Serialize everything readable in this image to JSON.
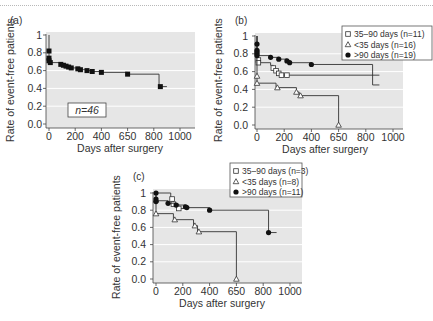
{
  "figure": {
    "background": "#ffffff",
    "plot_background": "#e6e6e6",
    "gridline_color": "#ffffff",
    "line_color": "#333333"
  },
  "chart_data": [
    {
      "panel_label": "(a)",
      "type": "line",
      "subtype": "kaplan-meier step",
      "title": "",
      "xlabel": "Days after surgery",
      "ylabel": "Rate of event-free patients",
      "xlim": [
        0,
        1000
      ],
      "ylim": [
        0,
        1
      ],
      "x_ticks": [
        0,
        200,
        400,
        600,
        800,
        1000
      ],
      "x_tick_labels": [
        "0",
        "200",
        "400",
        "650",
        "800",
        "1000"
      ],
      "y_ticks": [
        0,
        0.2,
        0.4,
        0.6,
        0.8,
        1
      ],
      "y_tick_labels": [
        "0.0",
        "0.2",
        "0.4",
        "0.6",
        "0.8",
        "1"
      ],
      "grid": true,
      "annotation": "n=46",
      "layout": {
        "x0": 49,
        "x1000": 180,
        "y0": 124,
        "y1": 35,
        "bg": [
          46,
          32,
          195,
          128
        ],
        "ytick_x": 44,
        "xtick_y": 140,
        "xlabel_pos": [
          120,
          152
        ],
        "ylabel_pos": [
          14,
          80
        ],
        "panel_label_pos": [
          10,
          24
        ],
        "annot_box": [
          68,
          103,
          38,
          14
        ]
      },
      "series": [
        {
          "name": "All patients (n=46)",
          "marker": "filled-square",
          "steps": [
            [
              0,
              1.0
            ],
            [
              0,
              0.74
            ],
            [
              0,
              0.71
            ],
            [
              10,
              0.69
            ],
            [
              90,
              0.67
            ],
            [
              110,
              0.66
            ],
            [
              130,
              0.65
            ],
            [
              150,
              0.64
            ],
            [
              170,
              0.63
            ],
            [
              220,
              0.62
            ],
            [
              240,
              0.61
            ],
            [
              290,
              0.6
            ],
            [
              330,
              0.59
            ],
            [
              400,
              0.58
            ],
            [
              600,
              0.56
            ],
            [
              840,
              0.42
            ]
          ],
          "end_x": 900,
          "censored": [
            [
              0,
              0.82
            ],
            [
              0,
              0.74
            ],
            [
              0,
              0.71
            ],
            [
              10,
              0.69
            ],
            [
              90,
              0.67
            ],
            [
              110,
              0.66
            ],
            [
              130,
              0.65
            ],
            [
              150,
              0.64
            ],
            [
              170,
              0.63
            ],
            [
              220,
              0.62
            ],
            [
              240,
              0.61
            ],
            [
              290,
              0.6
            ],
            [
              330,
              0.59
            ],
            [
              400,
              0.58
            ],
            [
              600,
              0.56
            ],
            [
              850,
              0.42
            ]
          ]
        }
      ]
    },
    {
      "panel_label": "(b)",
      "type": "line",
      "subtype": "kaplan-meier step",
      "title": "",
      "xlabel": "Days after surgery",
      "ylabel": "Rate of event-free patients",
      "xlim": [
        0,
        1000
      ],
      "ylim": [
        0,
        1
      ],
      "x_ticks": [
        0,
        200,
        400,
        600,
        800,
        1000
      ],
      "x_tick_labels": [
        "0",
        "200",
        "400",
        "650",
        "800",
        "1000"
      ],
      "y_ticks": [
        0,
        0.2,
        0.4,
        0.6,
        0.8,
        1
      ],
      "y_tick_labels": [
        "0.0",
        "0.2",
        "0.4",
        "0.6",
        "0.8",
        "1"
      ],
      "grid": true,
      "legend_position": "upper right",
      "layout": {
        "x0": 257,
        "x1000": 393,
        "y0": 125,
        "y1": 36,
        "bg": [
          255,
          33,
          403,
          129
        ],
        "ytick_x": 250,
        "xtick_y": 141,
        "xlabel_pos": [
          325,
          153
        ],
        "ylabel_pos": [
          222,
          80
        ],
        "panel_label_pos": [
          235,
          24
        ],
        "legend_box": [
          342,
          26,
          90,
          34
        ]
      },
      "series": [
        {
          "name": "35–90 days (n=11)",
          "marker": "open-square",
          "steps": [
            [
              0,
              1.0
            ],
            [
              0,
              0.78
            ],
            [
              10,
              0.7
            ],
            [
              100,
              0.67
            ],
            [
              120,
              0.64
            ],
            [
              140,
              0.61
            ],
            [
              160,
              0.58
            ],
            [
              180,
              0.56
            ]
          ],
          "end_x": 900,
          "censored": [
            [
              10,
              0.73
            ],
            [
              10,
              0.7
            ],
            [
              120,
              0.64
            ],
            [
              140,
              0.61
            ],
            [
              160,
              0.58
            ],
            [
              180,
              0.56
            ],
            [
              220,
              0.56
            ]
          ]
        },
        {
          "name": "<35 days (n=16)",
          "marker": "open-triangle",
          "steps": [
            [
              0,
              1.0
            ],
            [
              0,
              0.55
            ],
            [
              0,
              0.47
            ],
            [
              140,
              0.42
            ],
            [
              290,
              0.37
            ],
            [
              310,
              0.33
            ],
            [
              600,
              0.0
            ]
          ],
          "end_x": 600,
          "censored": [
            [
              0,
              0.55
            ],
            [
              0,
              0.47
            ],
            [
              150,
              0.42
            ],
            [
              290,
              0.37
            ],
            [
              320,
              0.33
            ],
            [
              600,
              0.0
            ]
          ]
        },
        {
          "name": ">90 days (n=19)",
          "marker": "filled-circle",
          "steps": [
            [
              0,
              1.0
            ],
            [
              0,
              0.78
            ],
            [
              100,
              0.76
            ],
            [
              160,
              0.74
            ],
            [
              220,
              0.72
            ],
            [
              240,
              0.7
            ],
            [
              400,
              0.68
            ],
            [
              850,
              0.45
            ]
          ],
          "end_x": 900,
          "censored": [
            [
              0,
              0.91
            ],
            [
              0,
              0.84
            ],
            [
              0,
              0.82
            ],
            [
              0,
              0.8
            ],
            [
              0,
              0.78
            ],
            [
              100,
              0.76
            ],
            [
              160,
              0.74
            ],
            [
              220,
              0.72
            ],
            [
              240,
              0.7
            ],
            [
              400,
              0.68
            ]
          ]
        }
      ]
    },
    {
      "panel_label": "(c)",
      "type": "line",
      "subtype": "kaplan-meier step",
      "title": "",
      "xlabel": "Days after surgery",
      "ylabel": "Rate of event-free patients",
      "xlim": [
        0,
        1000
      ],
      "ylim": [
        0,
        1
      ],
      "x_ticks": [
        0,
        200,
        400,
        600,
        800,
        1000
      ],
      "x_tick_labels": [
        "0",
        "200",
        "400",
        "650",
        "800",
        "1000"
      ],
      "y_ticks": [
        0,
        0.2,
        0.4,
        0.6,
        0.8,
        1
      ],
      "y_tick_labels": [
        "0.0",
        "0.2",
        "0.4",
        "0.6",
        "0.8",
        "1"
      ],
      "grid": true,
      "legend_position": "upper right",
      "layout": {
        "x0": 156,
        "x1000": 290,
        "y0": 279,
        "y1": 193,
        "bg": [
          153,
          189,
          302,
          283
        ],
        "ytick_x": 148,
        "xtick_y": 295,
        "xlabel_pos": [
          222,
          307
        ],
        "ylabel_pos": [
          120,
          237
        ],
        "panel_label_pos": [
          133,
          180
        ],
        "legend_box": [
          230,
          163,
          72,
          34
        ]
      },
      "series": [
        {
          "name": "35–90 days (n=3)",
          "marker": "open-square",
          "steps": [
            [
              0,
              1.0
            ],
            [
              110,
              0.93
            ],
            [
              130,
              0.87
            ],
            [
              170,
              0.82
            ]
          ],
          "end_x": 240,
          "censored": [
            [
              120,
              0.93
            ],
            [
              130,
              0.87
            ],
            [
              170,
              0.82
            ]
          ]
        },
        {
          "name": "<35 days (n=8)",
          "marker": "open-triangle",
          "steps": [
            [
              0,
              1.0
            ],
            [
              0,
              0.92
            ],
            [
              0,
              0.76
            ],
            [
              130,
              0.69
            ],
            [
              280,
              0.62
            ],
            [
              310,
              0.55
            ],
            [
              600,
              0.0
            ]
          ],
          "end_x": 600,
          "censored": [
            [
              0,
              0.92
            ],
            [
              0,
              0.76
            ],
            [
              140,
              0.69
            ],
            [
              290,
              0.62
            ],
            [
              320,
              0.55
            ],
            [
              600,
              0.0
            ]
          ]
        },
        {
          "name": ">90 days (n=11)",
          "marker": "filled-circle",
          "steps": [
            [
              0,
              1.0
            ],
            [
              0,
              0.91
            ],
            [
              90,
              0.88
            ],
            [
              150,
              0.86
            ],
            [
              220,
              0.83
            ],
            [
              400,
              0.8
            ],
            [
              840,
              0.54
            ]
          ],
          "end_x": 900,
          "censored": [
            [
              0,
              1.0
            ],
            [
              0,
              0.93
            ],
            [
              0,
              0.9
            ],
            [
              90,
              0.88
            ],
            [
              150,
              0.86
            ],
            [
              220,
              0.84
            ],
            [
              230,
              0.83
            ],
            [
              400,
              0.8
            ],
            [
              840,
              0.54
            ]
          ]
        }
      ]
    }
  ]
}
